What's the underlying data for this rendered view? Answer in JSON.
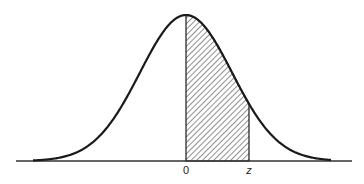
{
  "figure": {
    "type": "normal-distribution-area",
    "labels": {
      "origin": "0",
      "upper": "z"
    },
    "colors": {
      "curve": "#1a1a1a",
      "axis": "#333333",
      "hatch": "#333333",
      "background": "#ffffff"
    },
    "geometry": {
      "baseline_y": 161,
      "axis_x_start": 16,
      "axis_x_end": 352,
      "mean_x": 186,
      "peak_y": 15,
      "sigma_px": 46,
      "curve_x_start": 33,
      "curve_x_end": 331,
      "shade_from_x": 186,
      "shade_to_x": 249
    }
  }
}
